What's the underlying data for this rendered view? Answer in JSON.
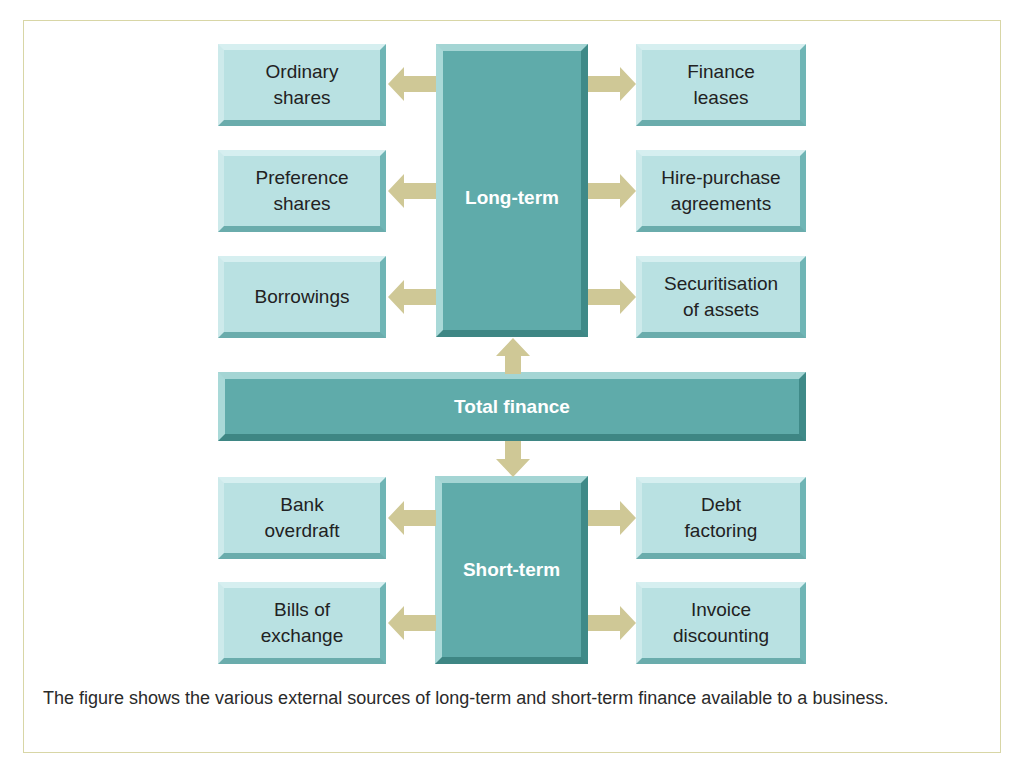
{
  "colors": {
    "small_box_fill": "#b9e1e2",
    "big_box_fill": "#5fabaa",
    "arrow_fill": "#cfc896",
    "frame_border": "#d8d6a6"
  },
  "diagram": {
    "long_term": {
      "label": "Long-term",
      "left_items": [
        {
          "label": "Ordinary\nshares"
        },
        {
          "label": "Preference\nshares"
        },
        {
          "label": "Borrowings"
        }
      ],
      "right_items": [
        {
          "label": "Finance\nleases"
        },
        {
          "label": "Hire-purchase\nagreements"
        },
        {
          "label": "Securitisation\nof assets"
        }
      ]
    },
    "total": {
      "label": "Total finance"
    },
    "short_term": {
      "label": "Short-term",
      "left_items": [
        {
          "label": "Bank\noverdraft"
        },
        {
          "label": "Bills of\nexchange"
        }
      ],
      "right_items": [
        {
          "label": "Debt\nfactoring"
        },
        {
          "label": "Invoice\ndiscounting"
        }
      ]
    }
  },
  "caption": "The figure shows the various external sources of long-term and short-term finance available to a business."
}
